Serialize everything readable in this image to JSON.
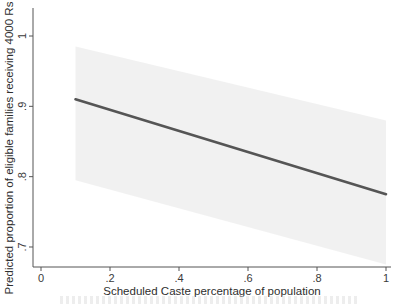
{
  "chart_data": {
    "type": "line",
    "title": "",
    "xlabel": "Scheduled Caste percentage of population",
    "ylabel": "Predicted proportion of eligible families receiving 4000 Rs",
    "xlim": [
      0,
      1
    ],
    "ylim": [
      0.665,
      1.05
    ],
    "x_ticks": [
      "0",
      ".2",
      ".4",
      ".6",
      ".8",
      "1"
    ],
    "x_tick_values": [
      0,
      0.2,
      0.4,
      0.6,
      0.8,
      1.0
    ],
    "y_ticks": [
      ".7",
      ".8",
      ".9",
      "1"
    ],
    "y_tick_values": [
      0.7,
      0.8,
      0.9,
      1.0
    ],
    "grid": false,
    "legend": null,
    "series": [
      {
        "name": "Predicted proportion",
        "x": [
          0.1,
          1.0
        ],
        "values": [
          0.91,
          0.775
        ],
        "color": "#555555"
      }
    ],
    "confidence_band": {
      "x": [
        0.1,
        1.0
      ],
      "upper": [
        0.985,
        0.88
      ],
      "lower": [
        0.795,
        0.675
      ],
      "color": "#e6e6e6"
    }
  }
}
